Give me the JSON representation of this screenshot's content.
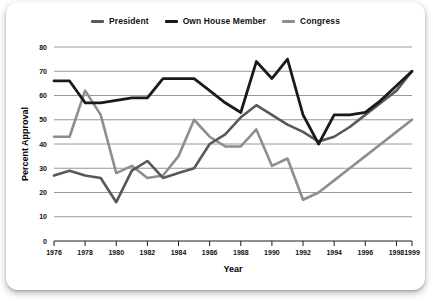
{
  "chart_data": {
    "type": "line",
    "title": "",
    "xlabel": "Year",
    "ylabel": "Percent Approval",
    "ylim": [
      0,
      80
    ],
    "xlim": [
      1976,
      1999
    ],
    "yticks": [
      0,
      10,
      20,
      30,
      40,
      50,
      60,
      70,
      80
    ],
    "xticks": [
      1976,
      1978,
      1980,
      1982,
      1984,
      1986,
      1988,
      1990,
      1992,
      1994,
      1996,
      1998,
      1999
    ],
    "xtick_labels": [
      "1976",
      "1978",
      "1980",
      "1982",
      "1984",
      "1986",
      "1988",
      "1990",
      "1992",
      "1994",
      "1996",
      "1998",
      "1999"
    ],
    "ytick_labels": [
      "0",
      "10",
      "20",
      "30",
      "40",
      "50",
      "60",
      "70",
      "80"
    ],
    "grid": true,
    "grid_color": "#8c8c8c",
    "legend_position": "top-center",
    "x": [
      1976,
      1977,
      1978,
      1979,
      1980,
      1981,
      1982,
      1983,
      1984,
      1985,
      1986,
      1987,
      1988,
      1989,
      1990,
      1991,
      1992,
      1993,
      1994,
      1995,
      1996,
      1997,
      1998,
      1999
    ],
    "series": [
      {
        "name": "President",
        "color": "#58585a",
        "width": 2.6,
        "values": [
          27,
          29,
          27,
          26,
          16,
          29,
          33,
          26,
          28,
          30,
          40,
          44,
          51,
          56,
          52,
          48,
          45,
          41,
          43,
          47,
          52,
          57,
          62,
          70
        ]
      },
      {
        "name": "Own House Member",
        "color": "#1a1a1a",
        "width": 2.8,
        "values": [
          66,
          66,
          57,
          57,
          58,
          59,
          59,
          67,
          67,
          67,
          62,
          57,
          53,
          74,
          67,
          75,
          52,
          40,
          52,
          52,
          53,
          58,
          64,
          70
        ]
      },
      {
        "name": "Congress",
        "color": "#8e8e90",
        "width": 2.6,
        "values": [
          43,
          43,
          62,
          52,
          28,
          31,
          26,
          27,
          35,
          50,
          43,
          39,
          39,
          46,
          31,
          34,
          17,
          20,
          25,
          30,
          35,
          40,
          45,
          50
        ]
      }
    ],
    "series_display_order": [
      "President",
      "Own House Member",
      "Congress"
    ]
  },
  "legend": {
    "items": [
      {
        "label": "President",
        "color": "#58585a"
      },
      {
        "label": "Own House Member",
        "color": "#1a1a1a"
      },
      {
        "label": "Congress",
        "color": "#8e8e90"
      }
    ]
  },
  "axes": {
    "y_title": "Percent Approval",
    "x_title": "Year"
  }
}
